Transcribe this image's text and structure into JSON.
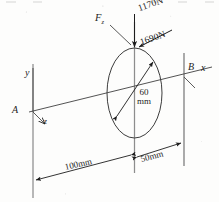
{
  "figure": {
    "type": "engineering-mechanics-free-body-diagram",
    "ink_color": "#1d1d1d",
    "background_color": "#fdfdfc"
  },
  "forces": {
    "vertical_load": "1170N",
    "inclined_load": "1690N",
    "axial_force_symbol": "F",
    "axial_force_subscript": "z"
  },
  "axes": {
    "x_label": "x",
    "y_label": "y",
    "z_label": "z"
  },
  "supports": {
    "left_label": "A",
    "right_label": "B"
  },
  "dimensions": {
    "span_a_to_disc": "100mm",
    "span_disc_to_b": "50mm",
    "disc_diameter_value": "60",
    "disc_diameter_unit": "mm"
  }
}
